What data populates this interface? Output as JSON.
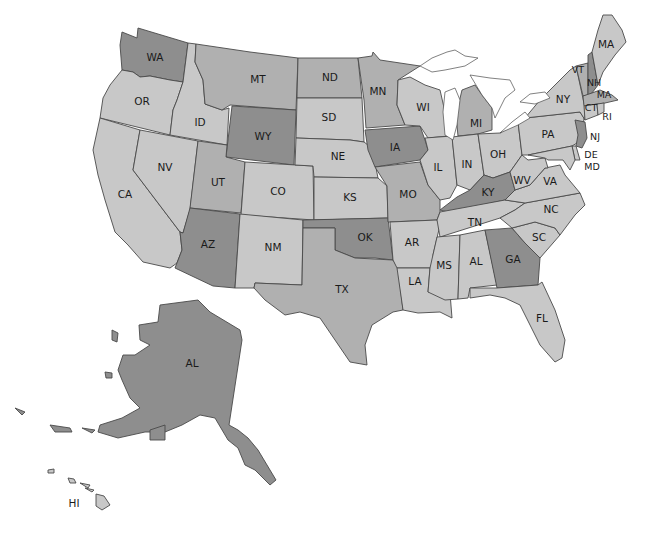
{
  "map": {
    "title": "United States",
    "colors": {
      "dark": "#8e8e8e",
      "medium": "#b0b0b0",
      "light": "#c8c8c8",
      "border": "#4a4a4a",
      "water": "#ffffff",
      "label": "#1a1a1a"
    },
    "states": [
      {
        "abbr": "WA",
        "label": "WA",
        "shade": "dark"
      },
      {
        "abbr": "OR",
        "label": "OR",
        "shade": "light"
      },
      {
        "abbr": "CA",
        "label": "CA",
        "shade": "light"
      },
      {
        "abbr": "ID",
        "label": "ID",
        "shade": "light"
      },
      {
        "abbr": "NV",
        "label": "NV",
        "shade": "light"
      },
      {
        "abbr": "MT",
        "label": "MT",
        "shade": "medium"
      },
      {
        "abbr": "WY",
        "label": "WY",
        "shade": "dark"
      },
      {
        "abbr": "UT",
        "label": "UT",
        "shade": "medium"
      },
      {
        "abbr": "AZ",
        "label": "AZ",
        "shade": "dark"
      },
      {
        "abbr": "CO",
        "label": "CO",
        "shade": "light"
      },
      {
        "abbr": "NM",
        "label": "NM",
        "shade": "light"
      },
      {
        "abbr": "ND",
        "label": "ND",
        "shade": "medium"
      },
      {
        "abbr": "SD",
        "label": "SD",
        "shade": "light"
      },
      {
        "abbr": "NE",
        "label": "NE",
        "shade": "light"
      },
      {
        "abbr": "KS",
        "label": "KS",
        "shade": "light"
      },
      {
        "abbr": "OK",
        "label": "OK",
        "shade": "dark"
      },
      {
        "abbr": "TX",
        "label": "TX",
        "shade": "medium"
      },
      {
        "abbr": "MN",
        "label": "MN",
        "shade": "medium"
      },
      {
        "abbr": "IA",
        "label": "IA",
        "shade": "dark"
      },
      {
        "abbr": "MO",
        "label": "MO",
        "shade": "medium"
      },
      {
        "abbr": "AR",
        "label": "AR",
        "shade": "light"
      },
      {
        "abbr": "LA",
        "label": "LA",
        "shade": "light"
      },
      {
        "abbr": "WI",
        "label": "WI",
        "shade": "light"
      },
      {
        "abbr": "IL",
        "label": "IL",
        "shade": "light"
      },
      {
        "abbr": "MI",
        "label": "MI",
        "shade": "medium"
      },
      {
        "abbr": "IN",
        "label": "IN",
        "shade": "light"
      },
      {
        "abbr": "OH",
        "label": "OH",
        "shade": "light"
      },
      {
        "abbr": "KY",
        "label": "KY",
        "shade": "dark"
      },
      {
        "abbr": "TN",
        "label": "TN",
        "shade": "light"
      },
      {
        "abbr": "MS",
        "label": "MS",
        "shade": "light"
      },
      {
        "abbr": "AL_state",
        "label": "AL",
        "shade": "light"
      },
      {
        "abbr": "GA",
        "label": "GA",
        "shade": "dark"
      },
      {
        "abbr": "FL",
        "label": "FL",
        "shade": "light"
      },
      {
        "abbr": "SC",
        "label": "SC",
        "shade": "light"
      },
      {
        "abbr": "NC",
        "label": "NC",
        "shade": "light"
      },
      {
        "abbr": "VA",
        "label": "VA",
        "shade": "light"
      },
      {
        "abbr": "WV",
        "label": "WV",
        "shade": "light"
      },
      {
        "abbr": "PA",
        "label": "PA",
        "shade": "light"
      },
      {
        "abbr": "NY",
        "label": "NY",
        "shade": "light"
      },
      {
        "abbr": "NJ",
        "label": "NJ",
        "shade": "dark"
      },
      {
        "abbr": "DE",
        "label": "DE",
        "shade": "light"
      },
      {
        "abbr": "MD",
        "label": "MD",
        "shade": "light"
      },
      {
        "abbr": "VT",
        "label": "VT",
        "shade": "medium"
      },
      {
        "abbr": "NH",
        "label": "NH",
        "shade": "dark"
      },
      {
        "abbr": "ME",
        "label": "MA",
        "shade": "light"
      },
      {
        "abbr": "MA",
        "label": "MA",
        "shade": "medium"
      },
      {
        "abbr": "CT",
        "label": "CT",
        "shade": "light"
      },
      {
        "abbr": "RI",
        "label": "RI",
        "shade": "light"
      },
      {
        "abbr": "AK",
        "label": "AL",
        "shade": "dark"
      },
      {
        "abbr": "HI",
        "label": "HI",
        "shade": "light"
      }
    ]
  }
}
